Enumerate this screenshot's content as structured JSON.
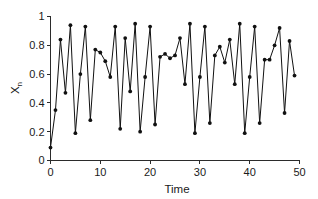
{
  "chart_data": {
    "type": "line",
    "title": "",
    "xlabel": "Time",
    "ylabel": "X",
    "ylabel_subscript": "n",
    "xlim": [
      0,
      50
    ],
    "ylim": [
      0,
      1
    ],
    "grid": false,
    "legend": null,
    "marker": "filled-circle",
    "line_color": "#111111",
    "marker_color": "#111111",
    "xticks": [
      0,
      10,
      20,
      30,
      40,
      50
    ],
    "xtick_labels": [
      "0",
      "10",
      "20",
      "30",
      "40",
      "50"
    ],
    "yticks": [
      0,
      0.2,
      0.4,
      0.6,
      0.8,
      1
    ],
    "ytick_labels": [
      "0",
      "0.2",
      "0.4",
      "0.6",
      "0.8",
      "1"
    ],
    "x": [
      0,
      1,
      2,
      3,
      4,
      5,
      6,
      7,
      8,
      9,
      10,
      11,
      12,
      13,
      14,
      15,
      16,
      17,
      18,
      19,
      20,
      21,
      22,
      23,
      24,
      25,
      26,
      27,
      28,
      29,
      30,
      31,
      32,
      33,
      34,
      35,
      36,
      37,
      38,
      39,
      40,
      41,
      42,
      43,
      44,
      45,
      46,
      47,
      48,
      49
    ],
    "values": [
      0.09,
      0.35,
      0.84,
      0.47,
      0.94,
      0.19,
      0.6,
      0.93,
      0.28,
      0.77,
      0.75,
      0.69,
      0.58,
      0.93,
      0.22,
      0.85,
      0.48,
      0.95,
      0.2,
      0.58,
      0.93,
      0.25,
      0.72,
      0.74,
      0.71,
      0.73,
      0.85,
      0.53,
      0.95,
      0.19,
      0.58,
      0.93,
      0.26,
      0.73,
      0.79,
      0.68,
      0.84,
      0.53,
      0.95,
      0.19,
      0.58,
      0.93,
      0.26,
      0.7,
      0.7,
      0.8,
      0.92,
      0.33,
      0.83,
      0.59
    ]
  },
  "axes": {
    "xlabel": "Time",
    "ylabel_main": "X",
    "ylabel_sub": "n"
  }
}
